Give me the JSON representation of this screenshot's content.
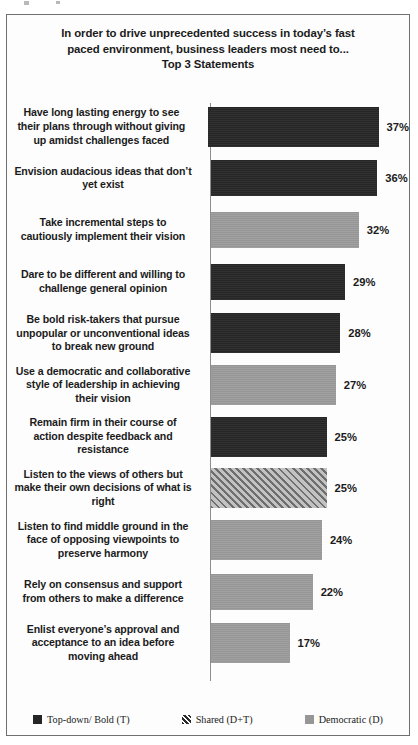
{
  "chart_data": {
    "type": "bar",
    "orientation": "horizontal",
    "title_lines": [
      "In order to drive unprecedented success in today’s fast",
      "paced environment, business leaders most need to...",
      "Top 3 Statements"
    ],
    "xlabel": "",
    "ylabel": "",
    "grid": false,
    "legend_position": "bottom",
    "xlim": [
      0,
      40
    ],
    "categories": [
      "Have long lasting energy to see their plans through without giving up amidst challenges faced",
      "Envision audacious ideas that don’t yet exist",
      "Take incremental steps to cautiously implement their vision",
      "Dare to be different and willing to challenge  general opinion",
      "Be bold risk-takers  that pursue unpopular or unconventional ideas to break new ground",
      "Use a democratic and collaborative style of leadership  in achieving their vision",
      "Remain firm in their course of action despite feedback and resistance",
      "Listen to the views of others but make their own decisions of what is right",
      "Listen to find middle ground in the face of opposing viewpoints  to preserve harmony",
      "Rely on consensus and support from others to make a difference",
      "Enlist everyone’s approval and acceptance to an idea before moving ahead"
    ],
    "values": [
      37,
      36,
      32,
      29,
      28,
      27,
      25,
      25,
      24,
      22,
      17
    ],
    "value_labels": [
      "37%",
      "36%",
      "32%",
      "29%",
      "28%",
      "27%",
      "25%",
      "25%",
      "24%",
      "22%",
      "17%"
    ],
    "point_styles": [
      "topdown",
      "topdown",
      "democratic",
      "topdown",
      "topdown",
      "democratic",
      "topdown",
      "shared",
      "democratic",
      "democratic",
      "democratic"
    ],
    "series": [
      {
        "name": "Top-down/ Bold (T)",
        "key": "topdown",
        "color": "#262626",
        "values": [
          37,
          36,
          null,
          29,
          28,
          null,
          25,
          null,
          null,
          null,
          null
        ]
      },
      {
        "name": "Shared (D+T)",
        "key": "shared",
        "color": "#9a9a9a",
        "values": [
          null,
          null,
          null,
          null,
          null,
          null,
          null,
          25,
          null,
          null,
          null
        ]
      },
      {
        "name": "Democratic (D)",
        "key": "democratic",
        "color": "#969696",
        "values": [
          null,
          null,
          32,
          null,
          null,
          27,
          null,
          null,
          24,
          22,
          17
        ]
      }
    ],
    "rows": [
      {
        "label_lines": [
          "Have long lasting energy to see",
          "their plans through without giving",
          "up amidst challenges faced"
        ],
        "value": 37,
        "value_label": "37%",
        "style": "topdown"
      },
      {
        "label_lines": [
          "Envision audacious ideas that don’t",
          "yet exist"
        ],
        "value": 36,
        "value_label": "36%",
        "style": "topdown"
      },
      {
        "label_lines": [
          "Take incremental steps to",
          "cautiously implement their vision"
        ],
        "value": 32,
        "value_label": "32%",
        "style": "democratic"
      },
      {
        "label_lines": [
          "Dare to be different and willing to",
          "challenge  general opinion"
        ],
        "value": 29,
        "value_label": "29%",
        "style": "topdown"
      },
      {
        "label_lines": [
          "Be bold risk-takers  that pursue",
          "unpopular or unconventional ideas",
          "to break new ground"
        ],
        "value": 28,
        "value_label": "28%",
        "style": "topdown"
      },
      {
        "label_lines": [
          "Use a democratic and collaborative",
          "style of leadership  in achieving",
          "their vision"
        ],
        "value": 27,
        "value_label": "27%",
        "style": "democratic"
      },
      {
        "label_lines": [
          "Remain firm in their course of",
          "action despite feedback and",
          "resistance"
        ],
        "value": 25,
        "value_label": "25%",
        "style": "topdown"
      },
      {
        "label_lines": [
          "Listen to the views of others but",
          "make their own decisions of what is",
          "right"
        ],
        "value": 25,
        "value_label": "25%",
        "style": "shared"
      },
      {
        "label_lines": [
          "Listen to find middle ground in the",
          "face of opposing viewpoints  to",
          "preserve harmony"
        ],
        "value": 24,
        "value_label": "24%",
        "style": "democratic"
      },
      {
        "label_lines": [
          "Rely on consensus and support",
          "from others to make a difference"
        ],
        "value": 22,
        "value_label": "22%",
        "style": "democratic"
      },
      {
        "label_lines": [
          "Enlist everyone’s approval and",
          "acceptance to an idea before",
          "moving ahead"
        ],
        "value": 17,
        "value_label": "17%",
        "style": "democratic"
      }
    ],
    "legend": [
      {
        "label": "Top-down/ Bold (T)",
        "key": "topdown",
        "color": "#262626"
      },
      {
        "label": "Shared (D+T)",
        "key": "shared",
        "color": "#9a9a9a"
      },
      {
        "label": "Democratic (D)",
        "key": "democratic",
        "color": "#969696"
      }
    ]
  }
}
